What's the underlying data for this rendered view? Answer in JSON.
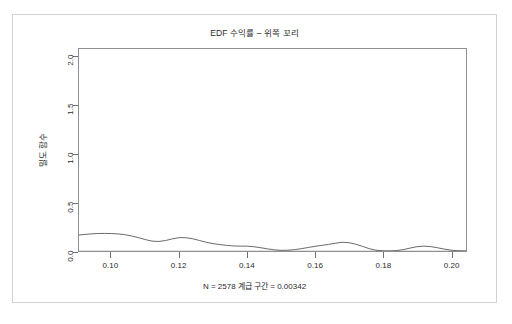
{
  "chart_data": {
    "type": "line",
    "title": "EDF 수익률 – 위쪽 꼬리",
    "xlabel": "N = 2578 계급 구간 = 0.00342",
    "ylabel": "밀도 함수",
    "xlim": [
      0.0905,
      0.2045
    ],
    "ylim": [
      0.0,
      2.08
    ],
    "xticks": [
      0.1,
      0.12,
      0.14,
      0.16,
      0.18,
      0.2
    ],
    "xtick_labels": [
      "0.10",
      "0.12",
      "0.14",
      "0.16",
      "0.18",
      "0.20"
    ],
    "yticks": [
      0.0,
      0.5,
      1.0,
      1.5,
      2.0
    ],
    "ytick_labels": [
      "0.0",
      "0.5",
      "1.0",
      "1.5",
      "2.0"
    ],
    "grid": false,
    "legend": null,
    "n": 2578,
    "bandwidth": 0.00342,
    "series": [
      {
        "name": "밀도 함수",
        "color": "#585858",
        "x": [
          0.0905,
          0.092,
          0.094,
          0.096,
          0.098,
          0.1,
          0.102,
          0.104,
          0.106,
          0.108,
          0.11,
          0.112,
          0.114,
          0.116,
          0.118,
          0.12,
          0.122,
          0.124,
          0.126,
          0.128,
          0.13,
          0.132,
          0.134,
          0.136,
          0.138,
          0.14,
          0.142,
          0.144,
          0.146,
          0.148,
          0.15,
          0.152,
          0.154,
          0.156,
          0.158,
          0.16,
          0.162,
          0.164,
          0.166,
          0.168,
          0.17,
          0.172,
          0.174,
          0.176,
          0.178,
          0.18,
          0.182,
          0.184,
          0.186,
          0.188,
          0.19,
          0.192,
          0.194,
          0.196,
          0.198,
          0.2,
          0.202,
          0.2045
        ],
        "y": [
          0.165,
          0.17,
          0.176,
          0.18,
          0.181,
          0.18,
          0.176,
          0.168,
          0.155,
          0.138,
          0.118,
          0.102,
          0.098,
          0.108,
          0.125,
          0.138,
          0.137,
          0.126,
          0.108,
          0.09,
          0.076,
          0.066,
          0.058,
          0.052,
          0.05,
          0.05,
          0.044,
          0.034,
          0.022,
          0.012,
          0.007,
          0.008,
          0.014,
          0.024,
          0.036,
          0.048,
          0.058,
          0.068,
          0.08,
          0.09,
          0.086,
          0.07,
          0.048,
          0.024,
          0.008,
          0.002,
          0.001,
          0.004,
          0.014,
          0.03,
          0.044,
          0.05,
          0.046,
          0.034,
          0.02,
          0.009,
          0.003,
          0.001
        ]
      },
      {
        "name": "기준선",
        "color": "#c9c9c9",
        "x": [
          0.0905,
          0.2045
        ],
        "y": [
          0.0,
          0.0
        ]
      }
    ]
  }
}
